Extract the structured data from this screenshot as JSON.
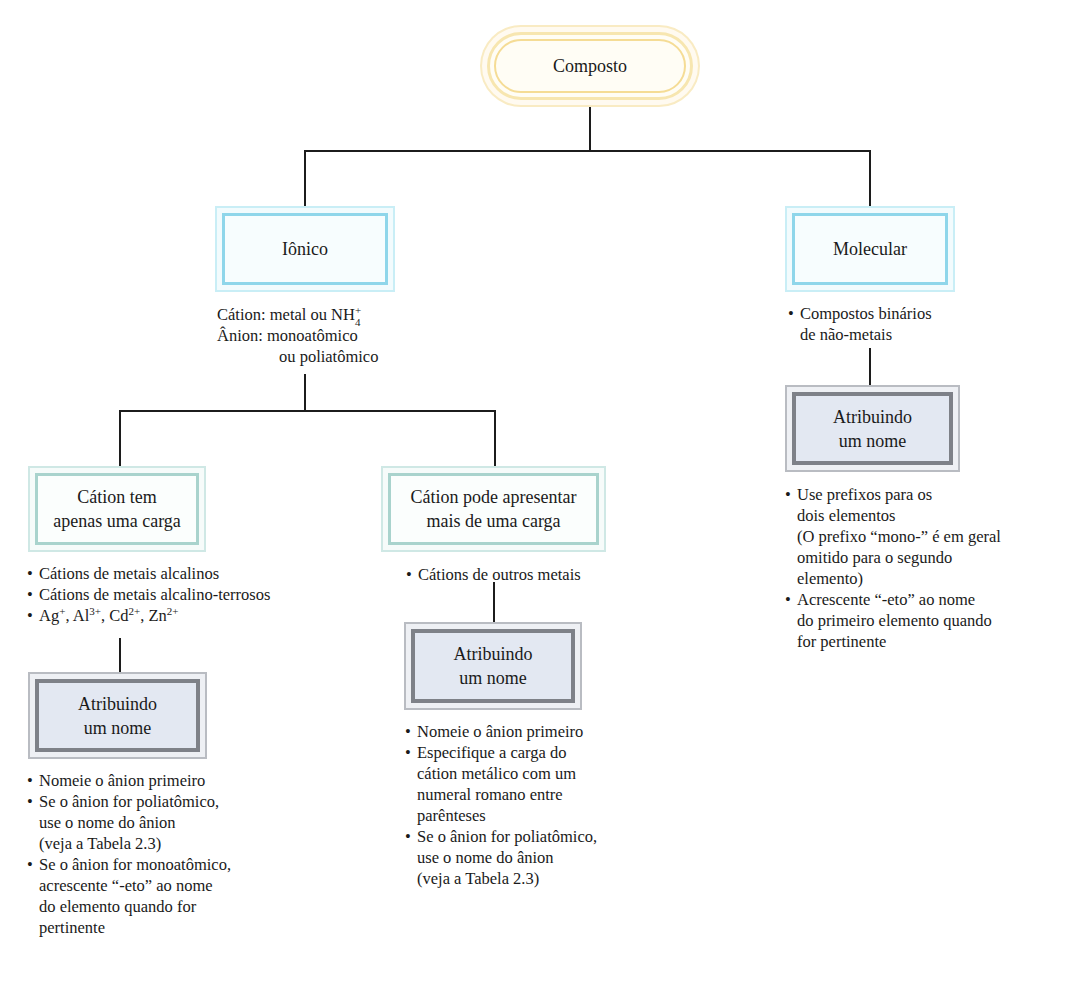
{
  "root": {
    "label": "Composto"
  },
  "branches": {
    "ionico": {
      "label": "Iônico",
      "description": [
        {
          "prefix": "Cátion:",
          "text": "metal ou NH",
          "sub": "4",
          "sup": "+"
        },
        {
          "prefix": "Ânion:",
          "text": "monoatômico"
        },
        {
          "prefix": "",
          "text": "ou poliatômico"
        }
      ],
      "children": {
        "uma_carga": {
          "label_line1": "Cátion tem",
          "label_line2": "apenas uma carga",
          "bullets": [
            "Cátions de metais alcalinos",
            "Cátions de metais alcalino-terrosos"
          ],
          "ions": [
            {
              "symbol": "Ag",
              "charge": "+"
            },
            {
              "symbol": "Al",
              "charge": "3+"
            },
            {
              "symbol": "Cd",
              "charge": "2+"
            },
            {
              "symbol": "Zn",
              "charge": "2+"
            }
          ],
          "naming": {
            "label_line1": "Atribuindo",
            "label_line2": "um nome",
            "bullets": [
              {
                "lines": [
                  "Nomeie o ânion primeiro"
                ]
              },
              {
                "lines": [
                  "Se o ânion for poliatômico,",
                  "use o nome do ânion",
                  "(veja a Tabela 2.3)"
                ]
              },
              {
                "lines": [
                  "Se o ânion for monoatômico,",
                  "acrescente “-eto” ao nome",
                  "do elemento quando for",
                  "pertinente"
                ]
              }
            ]
          }
        },
        "mais_cargas": {
          "label_line1": "Cátion pode apresentar",
          "label_line2": "mais de uma carga",
          "bullets": [
            "Cátions de outros metais"
          ],
          "naming": {
            "label_line1": "Atribuindo",
            "label_line2": "um nome",
            "bullets": [
              {
                "lines": [
                  "Nomeie o ânion primeiro"
                ]
              },
              {
                "lines": [
                  "Especifique a carga do",
                  "cátion metálico com um",
                  "numeral romano entre",
                  "parênteses"
                ]
              },
              {
                "lines": [
                  "Se o ânion for poliatômico,",
                  "use o nome do ânion",
                  "(veja a Tabela 2.3)"
                ]
              }
            ]
          }
        }
      }
    },
    "molecular": {
      "label": "Molecular",
      "bullets": [
        {
          "lines": [
            "Compostos binários",
            "de não-metais"
          ]
        }
      ],
      "naming": {
        "label_line1": "Atribuindo",
        "label_line2": "um nome",
        "bullets": [
          {
            "lines": [
              "Use prefixos para os",
              "dois elementos",
              "(O prefixo “mono-” é em geral",
              "omitido para o segundo",
              "elemento)"
            ]
          },
          {
            "lines": [
              "Acrescente “-eto” ao nome",
              "do primeiro elemento quando",
              "for pertinente"
            ]
          }
        ]
      }
    }
  },
  "colors": {
    "root_border": "#f5dc95",
    "category_border": "#8fd6ea",
    "subcategory_border": "#a9d3cd",
    "naming_border": "#7e8188",
    "naming_fill": "#e3e8f2",
    "connector": "#1c1c1c"
  },
  "bullet_glyph": "•"
}
